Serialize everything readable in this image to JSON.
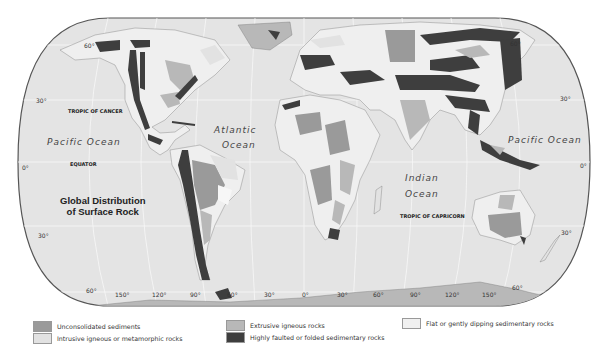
{
  "title": {
    "line1": "Global Distribution",
    "line2": "of Surface Rock"
  },
  "labels": {
    "pacific_west": "Pacific Ocean",
    "pacific_east": "Pacific Ocean",
    "atlantic_1": "Atlantic",
    "atlantic_2": "Ocean",
    "indian_1": "Indian",
    "indian_2": "Ocean",
    "tropic_cancer": "TROPIC OF CANCER",
    "equator": "EQUATOR",
    "tropic_capricorn": "TROPIC OF CAPRICORN"
  },
  "latitudes": {
    "n60_left": "60°",
    "n30_left": "30°",
    "eq_left": "0°",
    "s30_left": "30°",
    "n60_right": "60°",
    "n30_right": "30°",
    "eq_right": "0°",
    "s30_right": "30°",
    "s60_right": "60°"
  },
  "longitudes": [
    "60°",
    "150°",
    "120°",
    "90°",
    "60°",
    "30°",
    "0°",
    "30°",
    "60°",
    "90°",
    "120°",
    "150°",
    "60°"
  ],
  "legend": [
    {
      "label": "Unconsolidated sediments",
      "color": "#9a9a9a"
    },
    {
      "label": "Intrusive igneous or metamorphic rocks",
      "color": "#e2e2e2"
    },
    {
      "label": "Extrusive igneous rocks",
      "color": "#b8b8b8"
    },
    {
      "label": "Highly faulted or folded sedimentary rocks",
      "color": "#3e3e3e"
    },
    {
      "label": "Flat or gently dipping sedimentary rocks",
      "color": "#f0f0f0"
    }
  ],
  "colors": {
    "ocean": "#e4e4e4",
    "land_base": "#efefef",
    "outline": "#555555",
    "grid": "#f6f6f6"
  }
}
